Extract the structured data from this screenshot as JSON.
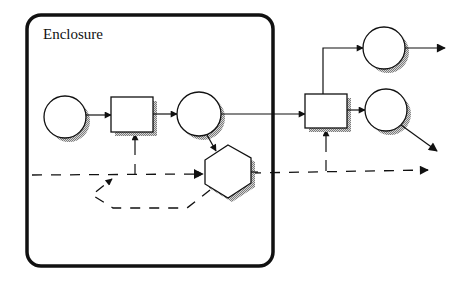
{
  "diagram": {
    "title": "Enclosure",
    "colors": {
      "stroke": "#111111",
      "background": "#ffffff",
      "shadow": "#9a9a9a"
    },
    "enclosure": {
      "label": "Enclosure",
      "x": 27,
      "y": 15,
      "width": 246,
      "height": 251,
      "corner_radius": 14
    },
    "nodes": [
      {
        "id": "place-input",
        "shape": "circle",
        "cx": 65,
        "cy": 117,
        "r": 21,
        "inside_enclosure": true
      },
      {
        "id": "transition-1",
        "shape": "box",
        "x": 111,
        "y": 97,
        "width": 42,
        "height": 35,
        "inside_enclosure": true
      },
      {
        "id": "place-middle",
        "shape": "circle",
        "cx": 199,
        "cy": 114,
        "r": 22,
        "inside_enclosure": true
      },
      {
        "id": "controller",
        "shape": "hexagon",
        "cx": 228,
        "cy": 171,
        "inside_enclosure": true
      },
      {
        "id": "transition-2",
        "shape": "box",
        "x": 305,
        "y": 94,
        "width": 42,
        "height": 34,
        "inside_enclosure": false
      },
      {
        "id": "place-output-top",
        "shape": "circle",
        "cx": 384,
        "cy": 48,
        "r": 21,
        "inside_enclosure": false
      },
      {
        "id": "place-output-bottom",
        "shape": "circle",
        "cx": 386,
        "cy": 110,
        "r": 21,
        "inside_enclosure": false
      }
    ],
    "edges": [
      {
        "from": "place-input",
        "to": "transition-1",
        "style": "solid"
      },
      {
        "from": "transition-1",
        "to": "place-middle",
        "style": "solid"
      },
      {
        "from": "place-middle",
        "to": "controller",
        "style": "solid"
      },
      {
        "from": "place-middle",
        "to": "transition-2",
        "style": "solid"
      },
      {
        "from": "transition-2",
        "to": "place-output-top",
        "style": "solid"
      },
      {
        "from": "transition-2",
        "to": "place-output-bottom",
        "style": "solid"
      },
      {
        "from": "place-output-top",
        "to": "exit-right",
        "style": "solid"
      },
      {
        "from": "place-output-bottom",
        "to": "exit-down-right",
        "style": "solid"
      },
      {
        "from": "control-line",
        "to": "transition-1",
        "style": "solid"
      },
      {
        "from": "control-line",
        "to": "transition-2",
        "style": "solid"
      },
      {
        "from": "control-line-left",
        "to": "controller",
        "style": "dashed"
      },
      {
        "from": "controller",
        "to": "control-line-right",
        "style": "dashed"
      },
      {
        "from": "controller",
        "to": "feedback-loop",
        "style": "dashed"
      }
    ]
  }
}
